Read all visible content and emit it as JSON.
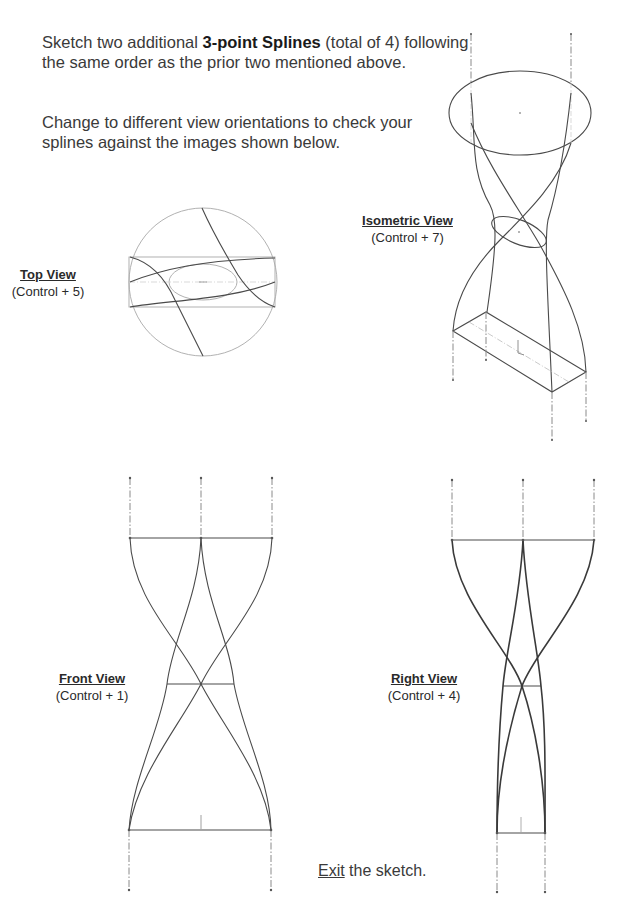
{
  "instructions": {
    "p1_prefix": "Sketch two additional ",
    "p1_bold": "3-point Splines",
    "p1_suffix": " (total of 4) following",
    "p1_line2": "the same order as the prior two mentioned above.",
    "p2_line1": "Change to different view orientations to check your",
    "p2_line2": "splines against the images shown below."
  },
  "views": {
    "top": {
      "title": "Top View",
      "shortcut": "(Control + 5)"
    },
    "isometric": {
      "title": "Isometric View",
      "shortcut": "(Control + 7)"
    },
    "front": {
      "title": "Front View",
      "shortcut": "(Control + 1)"
    },
    "right": {
      "title": "Right View",
      "shortcut": "(Control + 4)"
    }
  },
  "exit": {
    "link": "Exit",
    "rest": " the sketch."
  },
  "colors": {
    "line": "#4a4a4a",
    "construction": "#9a9a9a",
    "light": "#bdbdbd"
  }
}
